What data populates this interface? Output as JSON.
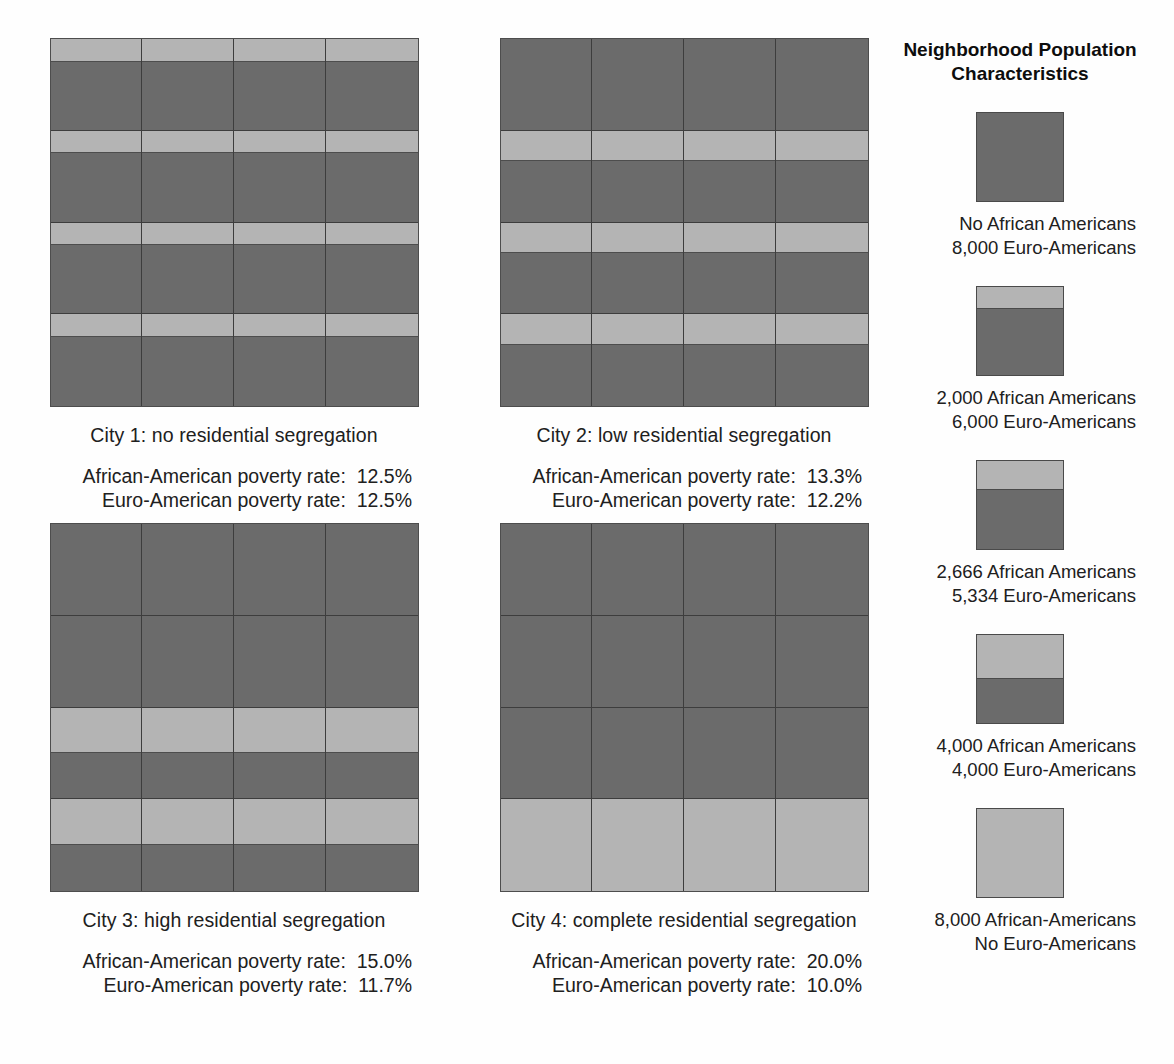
{
  "colors": {
    "african_american": "#b4b4b4",
    "euro_american": "#6b6b6b",
    "grid_line": "#3d3d3d",
    "background": "#fefefe",
    "text": "#202020"
  },
  "legend": {
    "title_line_1": "Neighborhood Population",
    "title_line_2": "Characteristics",
    "items": [
      {
        "light_fraction": 0,
        "line_1": "No African Americans",
        "line_2": "8,000 Euro-Americans",
        "african_american": 0,
        "euro_american": 8000
      },
      {
        "light_fraction": 0.25,
        "line_1": "2,000 African Americans",
        "line_2": "6,000 Euro-Americans",
        "african_american": 2000,
        "euro_american": 6000
      },
      {
        "light_fraction": 0.3333,
        "line_1": "2,666 African Americans",
        "line_2": "5,334 Euro-Americans",
        "african_american": 2666,
        "euro_american": 5334
      },
      {
        "light_fraction": 0.5,
        "line_1": "4,000 African Americans",
        "line_2": "4,000 Euro-Americans",
        "african_american": 4000,
        "euro_american": 4000
      },
      {
        "light_fraction": 1,
        "line_1": "8,000 African-Americans",
        "line_2": "No Euro-Americans",
        "african_american": 8000,
        "euro_american": 0
      }
    ]
  },
  "cities": [
    {
      "id": "city-1",
      "caption": "City 1: no residential segregation",
      "african_american_rate_label": "African-American poverty rate:  12.5%",
      "euro_american_rate_label": "Euro-American poverty rate:  12.5%",
      "african_american_rate": "12.5%",
      "euro_american_rate": "12.5%",
      "row_light_fractions": [
        0.25,
        0.25,
        0.25,
        0.25
      ]
    },
    {
      "id": "city-2",
      "caption": "City 2: low residential segregation",
      "african_american_rate_label": "African-American poverty rate:  13.3%",
      "euro_american_rate_label": "Euro-American poverty rate:  12.2%",
      "african_american_rate": "13.3%",
      "euro_american_rate": "12.2%",
      "row_light_fractions": [
        0,
        0.3333,
        0.3333,
        0.3333
      ]
    },
    {
      "id": "city-3",
      "caption": "City 3: high residential segregation",
      "african_american_rate_label": "African-American poverty rate:  15.0%",
      "euro_american_rate_label": "Euro-American poverty rate:  11.7%",
      "african_american_rate": "15.0%",
      "euro_american_rate": "11.7%",
      "row_light_fractions": [
        0,
        0,
        0.5,
        0.5
      ]
    },
    {
      "id": "city-4",
      "caption": "City 4: complete residential segregation",
      "african_american_rate_label": "African-American poverty rate:  20.0%",
      "euro_american_rate_label": "Euro-American poverty rate:  10.0%",
      "african_american_rate": "20.0%",
      "euro_american_rate": "10.0%",
      "row_light_fractions": [
        0,
        0,
        0,
        1
      ]
    }
  ],
  "chart_data": {
    "type": "diagram",
    "grid": "4x4 neighborhoods per city, each neighborhood holds 8,000 residents",
    "legend_position": "right",
    "series": [
      {
        "name": "City 1: no residential segregation",
        "african_american_poverty_rate": 12.5,
        "euro_american_poverty_rate": 12.5,
        "row_african_american_share": [
          0.25,
          0.25,
          0.25,
          0.25
        ]
      },
      {
        "name": "City 2: low residential segregation",
        "african_american_poverty_rate": 13.3,
        "euro_american_poverty_rate": 12.2,
        "row_african_american_share": [
          0,
          0.3333,
          0.3333,
          0.3333
        ]
      },
      {
        "name": "City 3: high residential segregation",
        "african_american_poverty_rate": 15.0,
        "euro_american_poverty_rate": 11.7,
        "row_african_american_share": [
          0,
          0,
          0.5,
          0.5
        ]
      },
      {
        "name": "City 4: complete residential segregation",
        "african_american_poverty_rate": 20.0,
        "euro_american_poverty_rate": 10.0,
        "row_african_american_share": [
          0,
          0,
          0,
          1
        ]
      }
    ]
  }
}
